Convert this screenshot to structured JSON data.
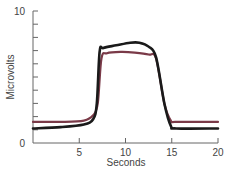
{
  "chart_data": {
    "type": "line",
    "title": "",
    "xlabel": "Seconds",
    "ylabel": "Microvolts",
    "xlim": [
      0,
      20
    ],
    "ylim": [
      0,
      10
    ],
    "x_ticks": [
      0,
      5,
      10,
      15,
      20
    ],
    "x_tick_labels": [
      "5",
      "10",
      "15",
      "20"
    ],
    "y_tick_labels": [
      "0",
      "10"
    ],
    "y_minor_ticks": [
      1,
      2,
      3,
      4,
      5,
      6,
      7,
      8,
      9,
      10
    ],
    "grid": false,
    "legend": null,
    "series": [
      {
        "name": "black",
        "color": "#1a1a1a",
        "points": [
          [
            0,
            1.1
          ],
          [
            3,
            1.2
          ],
          [
            5.5,
            1.4
          ],
          [
            6.5,
            1.8
          ],
          [
            6.9,
            3
          ],
          [
            7.2,
            6.9
          ],
          [
            7.6,
            7.2
          ],
          [
            9,
            7.4
          ],
          [
            10.5,
            7.6
          ],
          [
            11.5,
            7.6
          ],
          [
            12.5,
            7.3
          ],
          [
            13.3,
            6.5
          ],
          [
            14.2,
            3
          ],
          [
            14.9,
            1.3
          ],
          [
            15.5,
            1.1
          ],
          [
            20,
            1.1
          ]
        ]
      },
      {
        "name": "maroon",
        "color": "#7a3a48",
        "points": [
          [
            0,
            1.6
          ],
          [
            3,
            1.6
          ],
          [
            5.5,
            1.7
          ],
          [
            6.5,
            2.1
          ],
          [
            7.0,
            3
          ],
          [
            7.4,
            6.4
          ],
          [
            8,
            6.8
          ],
          [
            9.5,
            6.9
          ],
          [
            11,
            6.85
          ],
          [
            12.5,
            6.7
          ],
          [
            13.3,
            6.4
          ],
          [
            14.2,
            3
          ],
          [
            14.9,
            1.7
          ],
          [
            15.5,
            1.6
          ],
          [
            20,
            1.6
          ]
        ]
      }
    ]
  }
}
